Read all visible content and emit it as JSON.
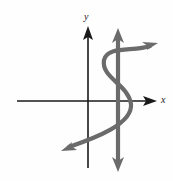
{
  "figure": {
    "background_color": "#fefefe",
    "width": 173,
    "height": 181,
    "axis_color": "#1a1a1a",
    "curve_color": "#6b6b6b",
    "test_line_color": "#6b6b6b",
    "labels": {
      "x_axis": "x",
      "y_axis": "y"
    },
    "axes": {
      "x_axis": {
        "name": "x-axis",
        "orientation": "horizontal",
        "y_position": 101,
        "start_x": 17,
        "end_x": 157,
        "arrowhead": "right"
      },
      "y_axis": {
        "name": "y-axis",
        "orientation": "vertical",
        "x_position": 88,
        "start_y": 168,
        "end_y": 26,
        "arrowhead": "up"
      }
    },
    "origin": {
      "x": 88,
      "y": 101
    },
    "vertical_test_line": {
      "name": "vertical-line-test",
      "x_position": 118,
      "top_y": 28,
      "bottom_y": 172,
      "arrowheads": "both",
      "stroke_width": 4
    },
    "curve": {
      "name": "s-shaped-curve",
      "shape": "sideways-S",
      "stroke_width": 4,
      "arrowheads": "both",
      "start_point": [
        62,
        150
      ],
      "end_point": [
        157,
        43
      ],
      "control_points": [
        [
          95,
          138
        ],
        [
          133,
          124
        ],
        [
          131,
          104
        ],
        [
          128,
          84
        ],
        [
          101,
          78
        ],
        [
          104,
          60
        ],
        [
          108,
          45
        ],
        [
          134,
          52
        ]
      ],
      "left_bulge_x": 101,
      "right_bulge_x": 133
    }
  }
}
